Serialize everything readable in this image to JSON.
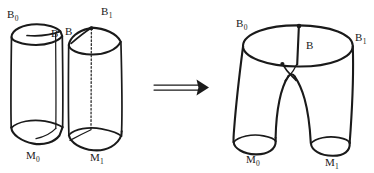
{
  "figure": {
    "kind": "hand-drawn-mathematical-diagram",
    "ink_color": "#1a1a1a",
    "background_color": "#ffffff",
    "relation_symbol": "double-right-arrow"
  },
  "labels": {
    "left_cylinder_top": {
      "base": "B",
      "sub": "0"
    },
    "left_cylinder_seam": {
      "base": "B",
      "sub": ""
    },
    "left_cylinder_bottom": {
      "base": "M",
      "sub": "0"
    },
    "right_cylinder_seam": {
      "base": "B",
      "sub": ""
    },
    "right_cylinder_top": {
      "base": "B",
      "sub": "1"
    },
    "right_cylinder_bottom": {
      "base": "M",
      "sub": "1"
    },
    "pants_top_left": {
      "base": "B",
      "sub": "0"
    },
    "pants_top_right": {
      "base": "B",
      "sub": "1"
    },
    "pants_seam": {
      "base": "B",
      "sub": ""
    },
    "pants_bottom_left": {
      "base": "M",
      "sub": "0"
    },
    "pants_bottom_right": {
      "base": "M",
      "sub": "1"
    }
  },
  "parts": {
    "left_cylinder": "cylinder-with-creased-top-B0-bottom-M0",
    "right_cylinder": "cylinder-with-dotted-axis-top-B1-bottom-M1",
    "arrow": "double-line-arrow-pointing-right",
    "pants": "pair-of-pants-surface-top-B0-B1-legs-M0-M1"
  }
}
